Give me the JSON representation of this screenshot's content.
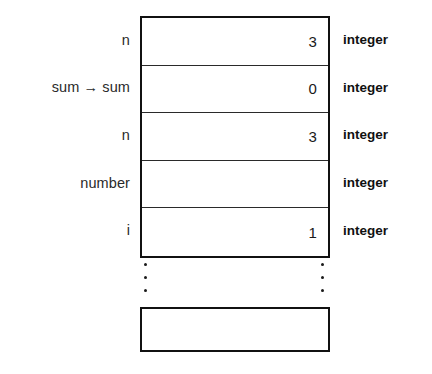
{
  "diagram": {
    "colors": {
      "ink": "#111111",
      "background": "#ffffff",
      "rule": "#2a2a2a"
    },
    "stack_rows": [
      {
        "name": "n",
        "value": "3",
        "type": "integer"
      },
      {
        "name": "sum → sum",
        "value": "0",
        "type": "integer"
      },
      {
        "name": "n",
        "value": "3",
        "type": "integer"
      },
      {
        "name": "number",
        "value": "",
        "type": "integer"
      },
      {
        "name": "i",
        "value": "1",
        "type": "integer"
      }
    ],
    "ellipsis": {
      "name": "vertical-ellipsis",
      "dot_count": 3,
      "glyph": "·"
    },
    "bottom_box": {
      "name": "empty-frame",
      "value": ""
    }
  }
}
